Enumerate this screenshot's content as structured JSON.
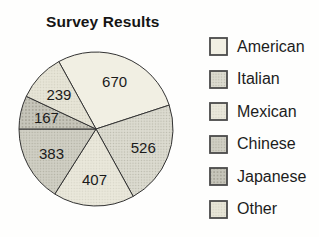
{
  "page": {
    "background_color": "#fefefd"
  },
  "chart_data": {
    "type": "pie",
    "title": "Survey Results",
    "total": 2392,
    "categories": [
      "American",
      "Italian",
      "Mexican",
      "Chinese",
      "Japanese",
      "Other"
    ],
    "values": [
      670,
      526,
      407,
      383,
      167,
      239
    ],
    "slices": [
      {
        "label": "American",
        "value": 670,
        "fill": "#f1efe3",
        "dot": null,
        "cell": 0
      },
      {
        "label": "Italian",
        "value": 526,
        "fill": "#dcdbd0",
        "dot": "#b9b8ab",
        "cell": 2.8
      },
      {
        "label": "Mexican",
        "value": 407,
        "fill": "#eae8db",
        "dot": "#d5d3c5",
        "cell": 2.8
      },
      {
        "label": "Chinese",
        "value": 383,
        "fill": "#d0cfc4",
        "dot": "#b0afa2",
        "cell": 2.8
      },
      {
        "label": "Japanese",
        "value": 167,
        "fill": "#c6c5ba",
        "dot": "#a19f92",
        "cell": 3.4
      },
      {
        "label": "Other",
        "value": 239,
        "fill": "#e7e5d7",
        "dot": "#d1cfc0",
        "cell": 2.8
      }
    ],
    "start_angle_deg": 118.9,
    "direction": "clockwise",
    "legend_position": "right",
    "outline_color": "#333333",
    "value_label_color": "#1a1a1a",
    "swatch_border_color": "#4a4a4a"
  }
}
